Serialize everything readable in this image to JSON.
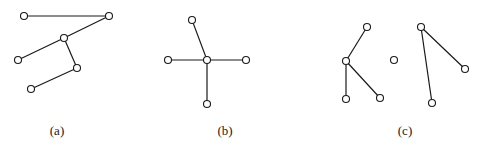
{
  "figure": {
    "width": 478,
    "height": 148,
    "stroke_color": "#1a1a1a",
    "background": "#ffffff",
    "node_radius": 3.5,
    "panels": [
      {
        "label": "(a)",
        "label_pos": [
          57,
          135
        ],
        "nodes": [
          [
            24,
            16
          ],
          [
            109,
            16
          ],
          [
            64,
            38
          ],
          [
            18,
            60
          ],
          [
            77,
            68
          ],
          [
            31,
            89
          ]
        ],
        "edges": [
          [
            0,
            1
          ],
          [
            1,
            2
          ],
          [
            2,
            3
          ],
          [
            2,
            4
          ],
          [
            4,
            5
          ]
        ]
      },
      {
        "label": "(b)",
        "label_pos": [
          225,
          135
        ],
        "nodes": [
          [
            207,
            60
          ],
          [
            192,
            20
          ],
          [
            168,
            60
          ],
          [
            246,
            60
          ],
          [
            207,
            104
          ]
        ],
        "edges": [
          [
            0,
            1
          ],
          [
            0,
            2
          ],
          [
            0,
            3
          ],
          [
            0,
            4
          ]
        ]
      },
      {
        "label": "(c)",
        "label_pos": [
          405,
          135
        ],
        "nodes": [
          [
            367,
            27
          ],
          [
            346,
            61
          ],
          [
            346,
            99
          ],
          [
            380,
            98
          ],
          [
            394,
            60
          ],
          [
            421,
            27
          ],
          [
            465,
            69
          ],
          [
            432,
            103
          ]
        ],
        "edges": [
          [
            0,
            1
          ],
          [
            1,
            2
          ],
          [
            1,
            3
          ],
          [
            5,
            6
          ],
          [
            5,
            7
          ]
        ]
      }
    ]
  }
}
